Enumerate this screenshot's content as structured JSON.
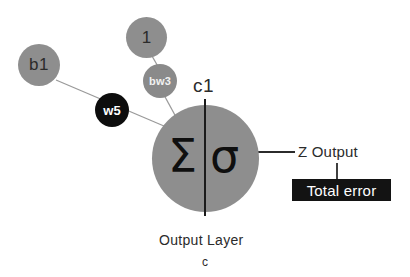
{
  "diagram": {
    "title_caption": "Output Layer",
    "subtitle_caption": "c",
    "neuron_label": "c1",
    "sum_glyph": "Σ",
    "activation_glyph": "σ",
    "output_label": "Z Output",
    "error_label": "Total error",
    "nodes": [
      {
        "id": "b1",
        "label": "b1",
        "kind": "bias"
      },
      {
        "id": "one",
        "label": "1",
        "kind": "constant"
      },
      {
        "id": "bw3",
        "label": "bw3",
        "kind": "weight-gray"
      },
      {
        "id": "w5",
        "label": "w5",
        "kind": "weight-black"
      }
    ],
    "colors": {
      "node_gray": "#8e8e8e",
      "weight_gray": "#8a8a8a",
      "weight_black": "#0d0d0d",
      "error_box": "#131313",
      "edge_line": "#9a9a9a",
      "dark_line": "#1b1b1b",
      "text_dark": "#2b2b2b",
      "text_light": "#ffffff",
      "background": "#ffffff"
    }
  }
}
